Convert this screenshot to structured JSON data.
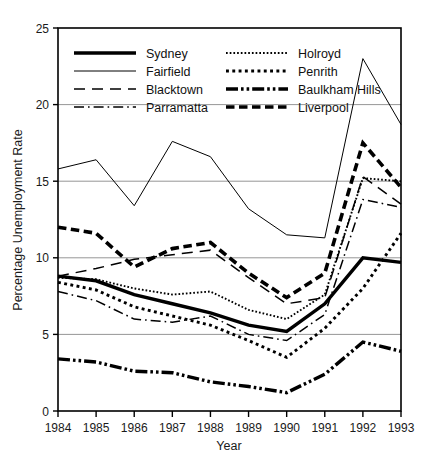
{
  "chart_data": {
    "type": "line",
    "title": "",
    "xlabel": "Year",
    "ylabel": "Percentage Unemployment Rate",
    "x": [
      1984,
      1985,
      1986,
      1987,
      1988,
      1989,
      1990,
      1991,
      1992,
      1993
    ],
    "xticklabels": [
      "1984",
      "1985",
      "1986",
      "1987",
      "1988",
      "1989",
      "1990",
      "1991",
      "1992",
      "1993"
    ],
    "yticklabels": [
      "0",
      "5",
      "10",
      "15",
      "20",
      "25"
    ],
    "yticks": [
      0,
      5,
      10,
      15,
      20,
      25
    ],
    "xlim": [
      1984,
      1993
    ],
    "ylim": [
      0,
      25
    ],
    "grid": "horizontal",
    "legend_position": "top-inside",
    "series": [
      {
        "name": "Sydney",
        "style": "thick-solid",
        "values": [
          8.8,
          8.5,
          7.6,
          7.0,
          6.4,
          5.6,
          5.2,
          7.0,
          10.0,
          9.7
        ]
      },
      {
        "name": "Fairfield",
        "style": "thin-solid",
        "values": [
          15.8,
          16.4,
          13.4,
          17.6,
          16.6,
          13.2,
          11.5,
          11.3,
          23.0,
          18.7
        ]
      },
      {
        "name": "Blacktown",
        "style": "long-dash",
        "values": [
          8.8,
          9.3,
          9.9,
          10.2,
          10.5,
          8.7,
          7.0,
          7.4,
          15.3,
          13.5
        ]
      },
      {
        "name": "Parramatta",
        "style": "dash-dot",
        "values": [
          7.8,
          7.2,
          6.0,
          5.8,
          6.2,
          5.0,
          4.6,
          6.3,
          13.8,
          13.3
        ]
      },
      {
        "name": "Holroyd",
        "style": "fine-dot",
        "values": [
          8.7,
          8.6,
          8.0,
          7.6,
          7.8,
          6.6,
          6.0,
          7.6,
          15.2,
          15.0
        ]
      },
      {
        "name": "Penrith",
        "style": "coarse-dot",
        "values": [
          8.4,
          7.9,
          6.8,
          6.2,
          5.6,
          4.6,
          3.5,
          5.4,
          8.0,
          11.6
        ]
      },
      {
        "name": "Baulkham Hills",
        "style": "thick-dash-dot-dot",
        "values": [
          3.4,
          3.2,
          2.6,
          2.5,
          1.9,
          1.6,
          1.2,
          2.4,
          4.5,
          3.9
        ]
      },
      {
        "name": "Liverpool",
        "style": "thick-dash",
        "values": [
          12.0,
          11.6,
          9.4,
          10.6,
          11.0,
          9.0,
          7.4,
          9.0,
          17.5,
          14.6
        ]
      }
    ]
  },
  "legend": {
    "items": [
      {
        "label": "Sydney"
      },
      {
        "label": "Fairfield"
      },
      {
        "label": "Blacktown"
      },
      {
        "label": "Parramatta"
      },
      {
        "label": "Holroyd"
      },
      {
        "label": "Penrith"
      },
      {
        "label": "Baulkham Hills"
      },
      {
        "label": "Liverpool"
      }
    ]
  },
  "colors": {
    "ink": "#000000",
    "grid": "#8a8a8a",
    "background": "#ffffff"
  }
}
